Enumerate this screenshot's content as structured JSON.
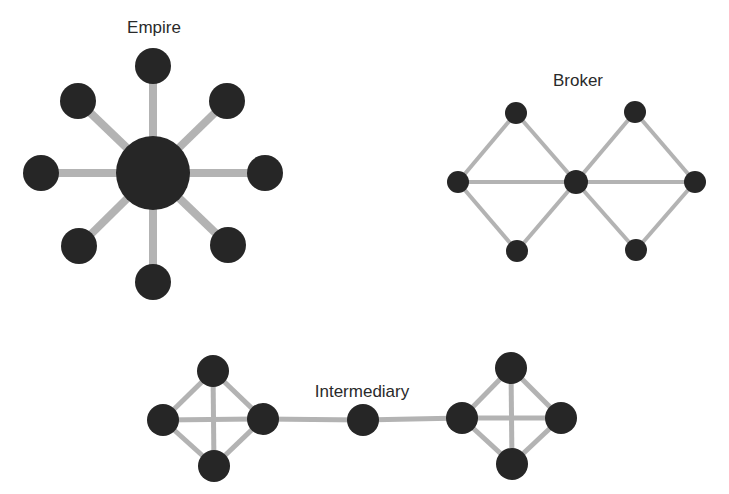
{
  "colors": {
    "background": "#ffffff",
    "node": "#262626",
    "edge": "#b3b3b3",
    "label": "#2a2a2a"
  },
  "networks": [
    {
      "id": "empire",
      "label": "Empire",
      "label_pos": [
        154,
        33
      ],
      "edge_width": 8,
      "nodes": [
        {
          "id": "hub",
          "x": 153,
          "y": 173,
          "r": 37
        },
        {
          "id": "n",
          "x": 153,
          "y": 66,
          "r": 18
        },
        {
          "id": "ne",
          "x": 227,
          "y": 101,
          "r": 18
        },
        {
          "id": "e",
          "x": 265,
          "y": 173,
          "r": 18
        },
        {
          "id": "se",
          "x": 228,
          "y": 245,
          "r": 18
        },
        {
          "id": "s",
          "x": 153,
          "y": 282,
          "r": 18
        },
        {
          "id": "sw",
          "x": 79,
          "y": 246,
          "r": 18
        },
        {
          "id": "w",
          "x": 41,
          "y": 173,
          "r": 18
        },
        {
          "id": "nw",
          "x": 78,
          "y": 101,
          "r": 18
        }
      ],
      "edges": [
        [
          "hub",
          "n"
        ],
        [
          "hub",
          "ne"
        ],
        [
          "hub",
          "e"
        ],
        [
          "hub",
          "se"
        ],
        [
          "hub",
          "s"
        ],
        [
          "hub",
          "sw"
        ],
        [
          "hub",
          "w"
        ],
        [
          "hub",
          "nw"
        ]
      ]
    },
    {
      "id": "broker",
      "label": "Broker",
      "label_pos": [
        578,
        86
      ],
      "edge_width": 4,
      "nodes": [
        {
          "id": "l",
          "x": 458,
          "y": 182,
          "r": 11
        },
        {
          "id": "tl",
          "x": 516,
          "y": 113,
          "r": 11
        },
        {
          "id": "bl",
          "x": 517,
          "y": 251,
          "r": 11
        },
        {
          "id": "c",
          "x": 576,
          "y": 182,
          "r": 12
        },
        {
          "id": "tr",
          "x": 635,
          "y": 112,
          "r": 11
        },
        {
          "id": "br",
          "x": 636,
          "y": 250,
          "r": 11
        },
        {
          "id": "r",
          "x": 695,
          "y": 182,
          "r": 11
        }
      ],
      "edges": [
        [
          "l",
          "tl"
        ],
        [
          "tl",
          "c"
        ],
        [
          "l",
          "bl"
        ],
        [
          "bl",
          "c"
        ],
        [
          "l",
          "c"
        ],
        [
          "c",
          "tr"
        ],
        [
          "tr",
          "r"
        ],
        [
          "c",
          "br"
        ],
        [
          "br",
          "r"
        ],
        [
          "c",
          "r"
        ]
      ]
    },
    {
      "id": "intermediary",
      "label": "Intermediary",
      "label_pos": [
        362,
        397
      ],
      "edge_width": 5,
      "nodes": [
        {
          "id": "a_t",
          "x": 213,
          "y": 371,
          "r": 16
        },
        {
          "id": "a_l",
          "x": 163,
          "y": 420,
          "r": 16
        },
        {
          "id": "a_r",
          "x": 263,
          "y": 419,
          "r": 16
        },
        {
          "id": "a_b",
          "x": 214,
          "y": 466,
          "r": 16
        },
        {
          "id": "mid",
          "x": 363,
          "y": 420,
          "r": 16
        },
        {
          "id": "b_t",
          "x": 511,
          "y": 368,
          "r": 16
        },
        {
          "id": "b_l",
          "x": 462,
          "y": 418,
          "r": 16
        },
        {
          "id": "b_r",
          "x": 561,
          "y": 418,
          "r": 16
        },
        {
          "id": "b_b",
          "x": 512,
          "y": 464,
          "r": 16
        }
      ],
      "edges": [
        [
          "a_t",
          "a_l"
        ],
        [
          "a_t",
          "a_r"
        ],
        [
          "a_b",
          "a_l"
        ],
        [
          "a_b",
          "a_r"
        ],
        [
          "a_t",
          "a_b"
        ],
        [
          "a_l",
          "a_r"
        ],
        [
          "a_r",
          "mid"
        ],
        [
          "mid",
          "b_l"
        ],
        [
          "b_t",
          "b_l"
        ],
        [
          "b_t",
          "b_r"
        ],
        [
          "b_b",
          "b_l"
        ],
        [
          "b_b",
          "b_r"
        ],
        [
          "b_t",
          "b_b"
        ],
        [
          "b_l",
          "b_r"
        ]
      ]
    }
  ]
}
